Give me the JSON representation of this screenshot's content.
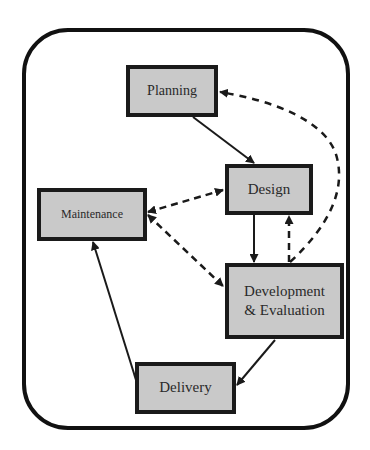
{
  "diagram": {
    "type": "process-cycle",
    "nodes": [
      {
        "id": "planning",
        "label": "Planning"
      },
      {
        "id": "design",
        "label": "Design"
      },
      {
        "id": "maintenance",
        "label": "Maintenance"
      },
      {
        "id": "development",
        "label_line1": "Development",
        "label_line2": "& Evaluation"
      },
      {
        "id": "delivery",
        "label": "Delivery"
      }
    ],
    "edges": [
      {
        "from": "planning",
        "to": "design",
        "style": "solid"
      },
      {
        "from": "design",
        "to": "development",
        "style": "solid"
      },
      {
        "from": "development",
        "to": "design",
        "style": "dashed"
      },
      {
        "from": "development",
        "to": "planning",
        "style": "dashed-curved"
      },
      {
        "from": "maintenance",
        "to": "design",
        "style": "dashed-bidirectional"
      },
      {
        "from": "maintenance",
        "to": "development",
        "style": "dashed-bidirectional"
      },
      {
        "from": "development",
        "to": "delivery",
        "style": "solid"
      },
      {
        "from": "delivery",
        "to": "maintenance",
        "style": "solid"
      }
    ],
    "colors": {
      "box_fill": "#c9c9c9",
      "border": "#1a1a1a",
      "background": "#ffffff"
    }
  }
}
